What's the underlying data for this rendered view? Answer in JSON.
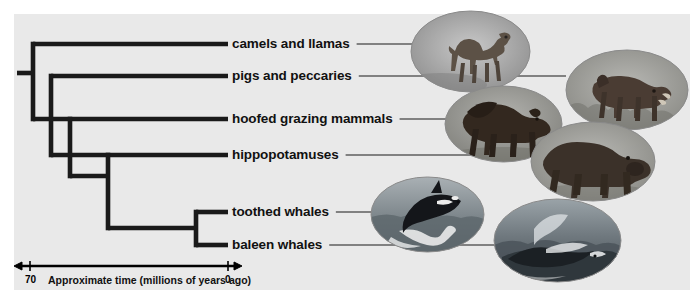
{
  "figure": {
    "type": "phylogenetic-tree-cladogram",
    "panel_background": "#e9e9e9",
    "page_background": "#ffffff",
    "branch_color": "#1a1a1a",
    "leader_line_color": "#1a1a1a"
  },
  "tips": [
    {
      "id": "camels",
      "label": "camels and llamas",
      "label_x": 232,
      "label_y": 44,
      "branch_y": 44,
      "branch_x_start": 33,
      "leader_x_end": 420,
      "photo": "camel"
    },
    {
      "id": "pigs",
      "label": "pigs and peccaries",
      "label_x": 232,
      "label_y": 76,
      "branch_y": 76,
      "branch_x_start": 51,
      "leader_x_end": 566,
      "photo": "warthog"
    },
    {
      "id": "hoofed",
      "label": "hoofed grazing mammals",
      "label_x": 232,
      "label_y": 119,
      "branch_y": 119,
      "branch_x_start": 70,
      "leader_x_end": 455,
      "photo": "bison"
    },
    {
      "id": "hippos",
      "label": "hippopotamuses",
      "label_x": 232,
      "label_y": 155,
      "branch_y": 155,
      "branch_x_start": 108,
      "leader_x_end": 540,
      "photo": "hippo"
    },
    {
      "id": "toothed",
      "label": "toothed whales",
      "label_x": 232,
      "label_y": 212,
      "branch_y": 212,
      "branch_x_start": 196,
      "leader_x_end": 378,
      "photo": "orca"
    },
    {
      "id": "baleen",
      "label": "baleen whales",
      "label_x": 232,
      "label_y": 245,
      "branch_y": 245,
      "branch_x_start": 196,
      "leader_x_end": 497,
      "photo": "humpback"
    }
  ],
  "nodes": [
    {
      "id": "root",
      "x": 33,
      "y_top": 44,
      "y_bottom": 119,
      "stub_x_start": 17,
      "stub_y": 73
    },
    {
      "id": "node-pigs",
      "x": 51,
      "y_top": 76,
      "y_bottom": 155
    },
    {
      "id": "node-hoofed",
      "x": 70,
      "y_top": 119,
      "y_bottom": 176
    },
    {
      "id": "node-hippo",
      "x": 108,
      "y_top": 155,
      "y_bottom": 228
    },
    {
      "id": "node-whales",
      "x": 196,
      "y_top": 212,
      "y_bottom": 245
    }
  ],
  "axis": {
    "left_value": "70",
    "right_value": "0",
    "caption": "Approximate time (millions of years ago)",
    "line_y": 266,
    "x_left": 18,
    "x_right": 238,
    "tick_left_x": 30,
    "tick_right_x": 228,
    "left_value_x": 25,
    "right_value_x": 225,
    "value_y": 275,
    "caption_x": 48,
    "caption_y": 275
  },
  "photos": [
    {
      "id": "camel",
      "name": "camel-photo",
      "alt": "camel",
      "x": 411,
      "y": 11,
      "w": 119,
      "h": 81
    },
    {
      "id": "warthog",
      "name": "warthog-photo",
      "alt": "warthog / peccary",
      "x": 566,
      "y": 50,
      "w": 122,
      "h": 80
    },
    {
      "id": "bison",
      "name": "bison-photo",
      "alt": "bison",
      "x": 445,
      "y": 86,
      "w": 117,
      "h": 76
    },
    {
      "id": "hippo",
      "name": "hippo-photo",
      "alt": "hippopotamus",
      "x": 531,
      "y": 122,
      "w": 124,
      "h": 79
    },
    {
      "id": "orca",
      "name": "orca-photo",
      "alt": "orca breaching",
      "x": 371,
      "y": 177,
      "w": 113,
      "h": 75
    },
    {
      "id": "humpback",
      "name": "humpback-photo",
      "alt": "humpback whale",
      "x": 494,
      "y": 199,
      "w": 127,
      "h": 83
    }
  ]
}
